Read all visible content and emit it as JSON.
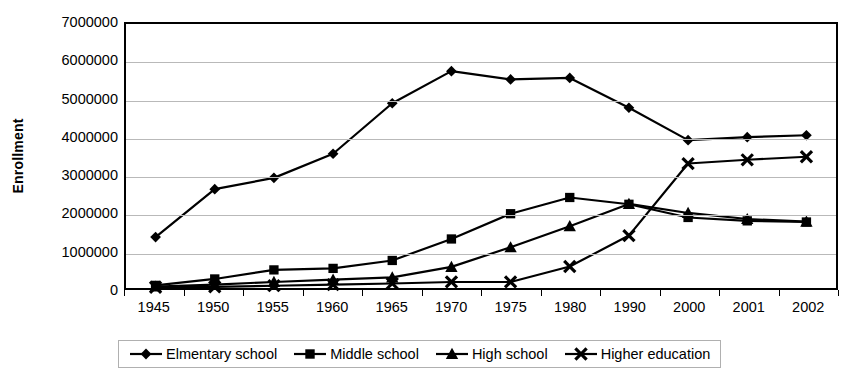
{
  "chart_data": {
    "type": "line",
    "title": "",
    "xlabel": "",
    "ylabel": "Enrollment",
    "categories": [
      "1945",
      "1950",
      "1955",
      "1960",
      "1965",
      "1970",
      "1975",
      "1980",
      "1990",
      "2000",
      "2001",
      "2002"
    ],
    "ylim": [
      0,
      7000000
    ],
    "ytick_labels": [
      "7000000",
      "6000000",
      "5000000",
      "4000000",
      "3000000",
      "2000000",
      "1000000",
      "0"
    ],
    "ytick_values": [
      7000000,
      6000000,
      5000000,
      4000000,
      3000000,
      2000000,
      1000000,
      0
    ],
    "grid": true,
    "legend_position": "bottom",
    "series": [
      {
        "name": "Elmentary school",
        "marker": "diamond",
        "values": [
          1350000,
          2620000,
          2920000,
          3560000,
          4900000,
          5750000,
          5530000,
          5570000,
          4780000,
          3920000,
          4000000,
          4050000
        ]
      },
      {
        "name": "Middle school",
        "marker": "square",
        "values": [
          70000,
          240000,
          480000,
          520000,
          730000,
          1300000,
          1970000,
          2400000,
          2220000,
          1870000,
          1780000,
          1750000
        ]
      },
      {
        "name": "High school",
        "marker": "triangle",
        "values": [
          40000,
          90000,
          160000,
          220000,
          280000,
          560000,
          1080000,
          1640000,
          2230000,
          1990000,
          1830000,
          1760000
        ]
      },
      {
        "name": "Higher education",
        "marker": "cross",
        "values": [
          20000,
          30000,
          60000,
          90000,
          120000,
          160000,
          160000,
          570000,
          1390000,
          3300000,
          3400000,
          3480000
        ]
      }
    ]
  },
  "colors": {
    "series": "#000000",
    "grid": "#b9b9b9",
    "axis": "#000000",
    "background": "#ffffff"
  }
}
